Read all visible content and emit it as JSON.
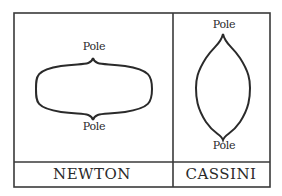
{
  "figure": {
    "panels": [
      {
        "name": "NEWTON",
        "shape": "oblate (flattened at poles)",
        "top_label": "Pole",
        "bottom_label": "Pole"
      },
      {
        "name": "CASSINI",
        "shape": "prolate (elongated at poles)",
        "top_label": "Pole",
        "bottom_label": "Pole"
      }
    ],
    "colors": {
      "ink": "#2a2a2a",
      "background": "#ffffff"
    }
  }
}
